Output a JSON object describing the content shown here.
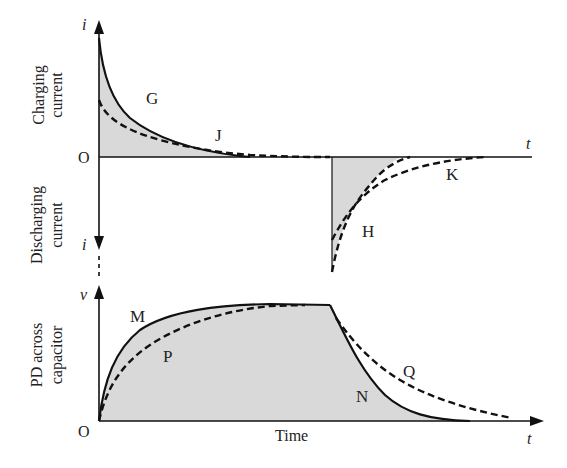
{
  "diagram": {
    "type": "capacitor charge/discharge graphs",
    "panels": [
      {
        "name": "current",
        "y_axis_label_top": "Charging current",
        "y_axis_label_bottom": "Discharging current",
        "y_axis_symbol_up": "i",
        "y_axis_symbol_down": "i",
        "x_axis_symbol": "t",
        "origin": "O",
        "curve_labels": {
          "G": "G",
          "J": "J",
          "H": "H",
          "K": "K"
        }
      },
      {
        "name": "voltage",
        "y_axis_label": "PD across capacitor",
        "y_axis_symbol": "v",
        "x_axis_symbol": "t",
        "x_axis_label": "Time",
        "origin": "O",
        "curve_labels": {
          "M": "M",
          "P": "P",
          "N": "N",
          "Q": "Q"
        }
      }
    ]
  },
  "labels": {
    "charging_line1": "Charging",
    "charging_line2": "current",
    "discharging_line1": "Discharging",
    "discharging_line2": "current",
    "pd_line1": "PD across",
    "pd_line2": "capacitor",
    "i_top": "i",
    "i_bottom": "i",
    "v": "v",
    "t_top": "t",
    "t_bottom": "t",
    "origin_top": "O",
    "origin_bottom": "O",
    "time": "Time",
    "G": "G",
    "J": "J",
    "H": "H",
    "K": "K",
    "M": "M",
    "P": "P",
    "N": "N",
    "Q": "Q"
  },
  "colors": {
    "ink": "#111111",
    "shade": "#d9d9d9",
    "background": "#ffffff"
  }
}
